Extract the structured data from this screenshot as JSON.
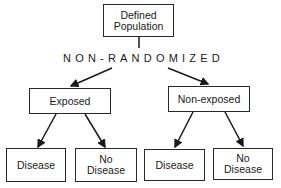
{
  "diagram": {
    "root": {
      "label_line1": "Defined",
      "label_line2": "Population"
    },
    "split_label": "NON-RANDOMIZED",
    "groups": [
      {
        "label": "Exposed",
        "outcomes": [
          {
            "label_line1": "Disease",
            "label_line2": ""
          },
          {
            "label_line1": "No",
            "label_line2": "Disease"
          }
        ]
      },
      {
        "label": "Non-exposed",
        "outcomes": [
          {
            "label_line1": "Disease",
            "label_line2": ""
          },
          {
            "label_line1": "No",
            "label_line2": "Disease"
          }
        ]
      }
    ],
    "colors": {
      "stroke": "#2a2a2a",
      "background": "#ffffff",
      "text": "#1a1a1a"
    }
  }
}
